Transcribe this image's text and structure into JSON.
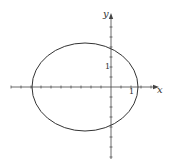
{
  "chart_data": {
    "type": "line",
    "title": "",
    "xlabel": "x",
    "ylabel": "y",
    "tick_labels": {
      "x": [
        "1"
      ],
      "y": [
        "1"
      ]
    },
    "tick_spacing": 0.5,
    "xlim": [
      -5,
      2.4
    ],
    "ylim": [
      -3.6,
      3.7
    ],
    "grid": false,
    "legend": null,
    "series": [
      {
        "name": "ellipse",
        "shape": "ellipse",
        "center": [
          -1.3,
          0
        ],
        "semi_axis_x": 2.65,
        "semi_axis_y": 2.2,
        "x_intercepts": [
          -3.95,
          1.35
        ],
        "y_intercepts": [
          2.0,
          -1.9
        ],
        "color": "#333333"
      }
    ]
  },
  "pixel_map": {
    "origin": [
      111,
      87
    ],
    "unit_px": 20
  },
  "labels": {
    "x_axis": "x",
    "y_axis": "y",
    "x_tick_one": "1",
    "y_tick_one": "1"
  },
  "colors": {
    "line": "#333333",
    "axis": "#444444"
  }
}
